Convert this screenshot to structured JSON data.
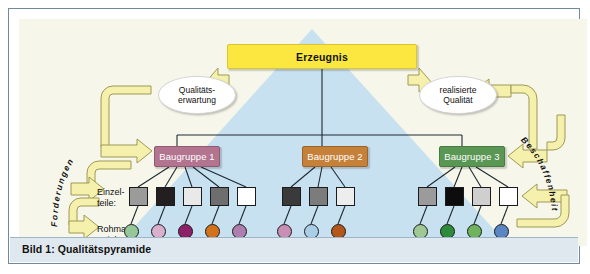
{
  "figure": {
    "caption": "Bild 1: Qualitätspyramide"
  },
  "colors": {
    "product_box": "#FBE73F",
    "assembly_1": "#B2748F",
    "assembly_2": "#C5813A",
    "assembly_3": "#5A9654",
    "pyramid_fill": "#C8E1F0",
    "backdrop": "#F7F6EA",
    "caption_bar": "#DFE8EE",
    "arrow_fill": "#F5F0AC"
  },
  "nodes": {
    "product": {
      "label": "Erzeugnis"
    },
    "assemblies": [
      {
        "label": "Baugruppe 1"
      },
      {
        "label": "Baugruppe 2"
      },
      {
        "label": "Baugruppe 3"
      }
    ]
  },
  "row_labels": {
    "parts": "Einzel-\nteile:",
    "material": "Rohma-\nterial:"
  },
  "callouts": {
    "expectation": "Qualitäts-\nerwartung",
    "realised": "realisierte\nQualität"
  },
  "arc_labels": {
    "left": "Forderungen",
    "right": "Beschaffenheit"
  },
  "parts": {
    "group1": [
      "#9B9B9B",
      "#231F20",
      "#E9E9E9",
      "#6E6E6E",
      "#FFFFFF"
    ],
    "group2": [
      "#3A3A3A",
      "#7C7C7C",
      "#EDEDED"
    ],
    "group3": [
      "#9B9B9B",
      "#0D0D0D",
      "#CFCFCF",
      "#FFFFFF"
    ]
  },
  "materials": {
    "group1": [
      "#96C79A",
      "#D9AFCE",
      "#8E2068",
      "#D4721B",
      "#AE7FAE"
    ],
    "group2": [
      "#C98EB4",
      "#A9CFE8",
      "#B4571A",
      "",
      ""
    ],
    "group3": [
      "#9FC894",
      "#2E8B3C",
      "#6FB45C",
      "#5A86C4"
    ]
  }
}
